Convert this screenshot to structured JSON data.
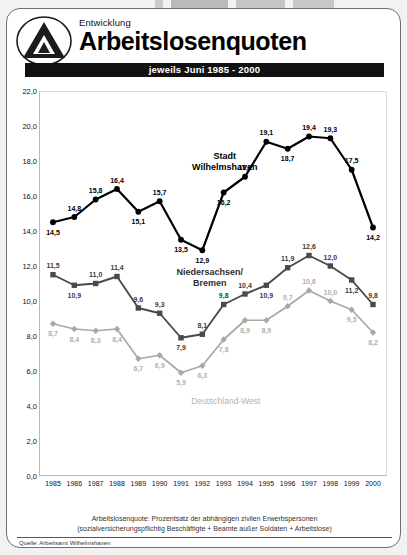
{
  "header": {
    "kicker": "Entwicklung",
    "title": "Arbeitslosenquoten",
    "subtitle": "jeweils Juni 1985 - 2000",
    "logo_icon": "triangle-a-logo-icon"
  },
  "footer": {
    "note_line1": "Arbeitslosenquote: Prozentsatz der abhängigen zivilen Erwerbspersonen",
    "note_line2": "(sozialversicherungspflichtig Beschäftigte + Beamte außer Soldaten + Arbeitslose)",
    "source": "Quelle: Arbeitsamt Wilhelmshaven"
  },
  "chart_data": {
    "type": "line",
    "title": "Arbeitslosenquoten",
    "subtitle": "jeweils Juni 1985 - 2000",
    "xlabel": "",
    "ylabel": "",
    "ylim": [
      0,
      22
    ],
    "ytick_step": 2,
    "grid": false,
    "legend": "inline-labels",
    "ytick_labels": [
      "0,0",
      "2,0",
      "4,0",
      "6,0",
      "8,0",
      "10,0",
      "12,0",
      "14,0",
      "16,0",
      "18,0",
      "20,0",
      "22,0"
    ],
    "categories": [
      "1985",
      "1986",
      "1987",
      "1988",
      "1989",
      "1990",
      "1991",
      "1992",
      "1993",
      "1994",
      "1995",
      "1996",
      "1997",
      "1998",
      "1999",
      "2000"
    ],
    "series": [
      {
        "name": "Stadt Wilhelmshaven",
        "color": "#000000",
        "marker": "circle",
        "values": [
          14.5,
          14.8,
          15.8,
          16.4,
          15.1,
          15.7,
          13.5,
          12.9,
          16.2,
          17.1,
          19.1,
          18.7,
          19.4,
          19.3,
          17.5,
          14.2
        ],
        "labels": [
          "14,5",
          "14,8",
          "15,8",
          "16,4",
          "15,1",
          "15,7",
          "13,5",
          "12,9",
          "16,2",
          "17,1",
          "19,1",
          "18,7",
          "19,4",
          "19,3",
          "17,5",
          "14,2"
        ]
      },
      {
        "name": "Niedersachsen/ Bremen",
        "color": "#4a4a4a",
        "marker": "square",
        "values": [
          11.5,
          10.9,
          11.0,
          11.4,
          9.6,
          9.3,
          7.9,
          8.1,
          9.8,
          10.4,
          10.9,
          11.9,
          12.6,
          12.0,
          11.2,
          9.8
        ],
        "labels": [
          "11,5",
          "10,9",
          "11,0",
          "11,4",
          "9,6",
          "9,3",
          "7,9",
          "8,1",
          "9,8",
          "10,4",
          "10,9",
          "11,9",
          "12,6",
          "12,0",
          "11,2",
          "9,8"
        ]
      },
      {
        "name": "Deutschland-West",
        "color": "#a8a8a8",
        "marker": "diamond",
        "values": [
          8.7,
          8.4,
          8.3,
          8.4,
          6.7,
          6.9,
          5.9,
          6.3,
          7.8,
          8.9,
          8.9,
          9.7,
          10.6,
          10.0,
          9.5,
          8.2
        ],
        "labels": [
          "8,7",
          "8,4",
          "8,3",
          "8,4",
          "6,7",
          "6,9",
          "5,9",
          "6,3",
          "7,8",
          "8,9",
          "8,9",
          "9,7",
          "10,6",
          "10,0",
          "9,5",
          "8,2"
        ]
      }
    ],
    "series_annotations": [
      {
        "text_line1": "Stadt",
        "text_line2": "Wilhelmshaven",
        "style": "sl-black",
        "x_index": 8.05,
        "y_value": 18.55
      },
      {
        "text_line1": "Niedersachsen/",
        "text_line2": "Bremen",
        "style": "sl-mid",
        "x_index": 7.35,
        "y_value": 11.95
      },
      {
        "text_line1": "Deutschland-West",
        "text_line2": "",
        "style": "sl-light",
        "x_index": 8.1,
        "y_value": 4.55
      }
    ]
  }
}
